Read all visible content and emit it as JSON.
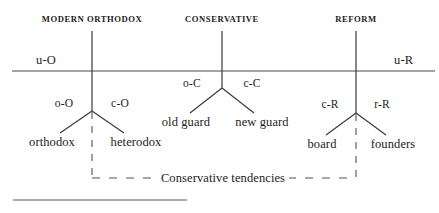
{
  "diagram": {
    "type": "tree-classification-diagram",
    "title_note": "Conservative tendencies",
    "background_color": "#ffffff",
    "line_color": "#3a3a3a",
    "text_color": "#1b1b1b",
    "columns": [
      {
        "id": "modern-orthodox",
        "header": "MODERN ORTHODOX",
        "x": 92,
        "above_line_label": "",
        "branch_labels": {
          "left": "o-O",
          "right": "c-O"
        },
        "leaves": {
          "left": "orthodox",
          "right": "heterodox"
        }
      },
      {
        "id": "conservative",
        "header": "CONSERVATIVE",
        "x": 222,
        "above_line_label": "",
        "branch_labels": {
          "left": "o-C",
          "right": "c-C"
        },
        "leaves": {
          "left": "old guard",
          "right": "new guard"
        }
      },
      {
        "id": "reform",
        "header": "REFORM",
        "x": 356,
        "above_line_label": "",
        "branch_labels": {
          "left": "c-R",
          "right": "r-R"
        },
        "leaves": {
          "left": "board",
          "right": "founders"
        }
      }
    ],
    "axis": {
      "left_label": "u-O",
      "right_label": "u-R",
      "y": 71,
      "x_start": 12,
      "x_end": 435
    },
    "bracket": {
      "label": "Conservative tendencies",
      "left_x": 92,
      "right_x": 356,
      "y": 178,
      "style": "dashed"
    },
    "footer_rule": {
      "x_start": 13,
      "x_end": 187,
      "y": 200
    }
  }
}
